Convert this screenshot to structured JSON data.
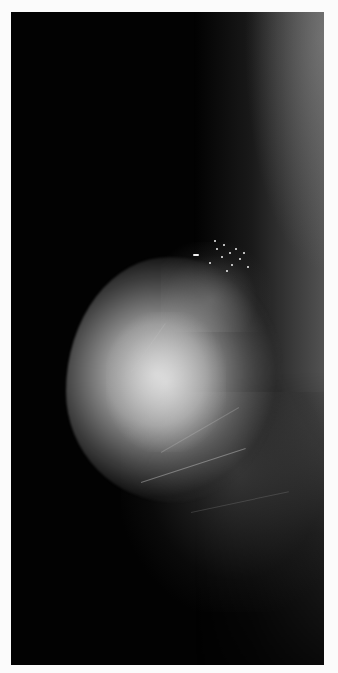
{
  "image": {
    "type": "mammogram",
    "view": "mediolateral oblique",
    "background_color": "#020202",
    "border_color": "#fbfbfb",
    "tissue_color": "#d7d7d7",
    "features": [
      {
        "name": "dense-fibroglandular-tissue",
        "position": "left-center"
      },
      {
        "name": "microcalcification-cluster",
        "position": "upper-right of mass"
      },
      {
        "name": "pectoral-muscle-edge",
        "position": "right edge"
      }
    ]
  }
}
